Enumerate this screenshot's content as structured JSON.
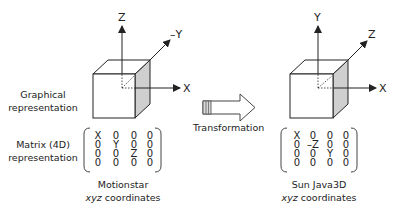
{
  "left_labels": {
    "graphical": [
      "Graphical",
      "representation"
    ],
    "matrix": [
      "Matrix (4D)",
      "representation"
    ]
  },
  "left_system": {
    "axes": {
      "up": "Z",
      "depth": "–Y",
      "right": "X"
    },
    "matrix": [
      [
        "X",
        "0",
        "0",
        "0"
      ],
      [
        "0",
        "Y",
        "0",
        "0"
      ],
      [
        "0",
        "0",
        "Z",
        "0"
      ],
      [
        "0",
        "0",
        "0",
        "0"
      ]
    ],
    "caption": {
      "name": "Motionstar",
      "sub": "xyz coordinates"
    }
  },
  "transform": {
    "label": "Transformation",
    "icon": "right-arrow-icon"
  },
  "right_system": {
    "axes": {
      "up": "Y",
      "depth": "Z",
      "right": "X"
    },
    "matrix": [
      [
        "X",
        "0",
        "0",
        "0"
      ],
      [
        "0",
        "–Z",
        "0",
        "0"
      ],
      [
        "0",
        "0",
        "Y",
        "0"
      ],
      [
        "0",
        "0",
        "0",
        "0"
      ]
    ],
    "caption": {
      "name": "Sun Java3D",
      "sub": "xyz coordinates"
    }
  },
  "colors": {
    "line": "#222222",
    "shade": "#cfcfcf",
    "arrow_fill": "#ffffff"
  }
}
